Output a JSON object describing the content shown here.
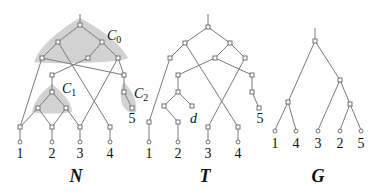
{
  "panels": [
    {
      "id": "N",
      "title": "N",
      "leaf_labels": [
        "1",
        "2",
        "3",
        "4",
        "5"
      ],
      "components": [
        {
          "name": "C",
          "sub": "0"
        },
        {
          "name": "C",
          "sub": "1"
        },
        {
          "name": "C",
          "sub": "2"
        }
      ]
    },
    {
      "id": "T",
      "title": "T",
      "leaf_labels": [
        "1",
        "2",
        "3",
        "4",
        "5"
      ],
      "extra_label": "d"
    },
    {
      "id": "G",
      "title": "G",
      "leaf_labels": [
        "1",
        "4",
        "3",
        "2",
        "5"
      ]
    }
  ],
  "colors": {
    "edge": "#7a7a7a",
    "shade": "#d2d2d2",
    "text": "#111111"
  }
}
